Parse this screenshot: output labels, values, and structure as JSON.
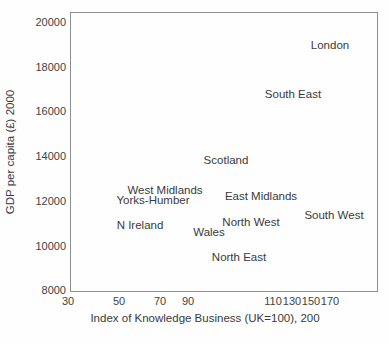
{
  "chart_data": {
    "type": "scatter",
    "title": "",
    "xlabel": "Index of Knowledge Business (UK=100), 200",
    "ylabel": "GDP per capita (£) 2000",
    "xlim": [
      30,
      170
    ],
    "ylim": [
      8000,
      20000
    ],
    "grid": false,
    "legend": "none",
    "marker_style": "text-labels-only",
    "points": [
      {
        "label": "London",
        "x": 165,
        "y": 19000,
        "px": 330,
        "py": 45
      },
      {
        "label": "South East",
        "x": 130,
        "y": 16800,
        "px": 293,
        "py": 94
      },
      {
        "label": "Scotland",
        "x": 98,
        "y": 13850,
        "px": 226,
        "py": 160
      },
      {
        "label": "West Midlands",
        "x": 73,
        "y": 12500,
        "px": 165,
        "py": 190
      },
      {
        "label": "Yorks-Humber",
        "x": 66,
        "y": 12100,
        "px": 153,
        "py": 200
      },
      {
        "label": "East Midlands",
        "x": 107,
        "y": 12250,
        "px": 261,
        "py": 196
      },
      {
        "label": "South West",
        "x": 172,
        "y": 11400,
        "px": 334,
        "py": 215
      },
      {
        "label": "North West",
        "x": 104,
        "y": 11100,
        "px": 251,
        "py": 222
      },
      {
        "label": "N Ireland",
        "x": 59,
        "y": 10950,
        "px": 140,
        "py": 225
      },
      {
        "label": "Wales",
        "x": 95,
        "y": 10650,
        "px": 209,
        "py": 232
      },
      {
        "label": "North East",
        "x": 101,
        "y": 9500,
        "px": 239,
        "py": 257
      }
    ],
    "x_ticks": [
      {
        "value": "30",
        "px": 68
      },
      {
        "value": "50",
        "px": 119
      },
      {
        "value": "70",
        "px": 160
      },
      {
        "value": "90",
        "px": 188
      },
      {
        "value": "110",
        "px": 273
      },
      {
        "value": "130",
        "px": 292
      },
      {
        "value": "150",
        "px": 311
      },
      {
        "value": "170",
        "px": 330
      }
    ],
    "y_ticks": [
      {
        "value": "20000",
        "py": 22
      },
      {
        "value": "18000",
        "py": 67
      },
      {
        "value": "16000",
        "py": 111
      },
      {
        "value": "14000",
        "py": 156
      },
      {
        "value": "12000",
        "py": 201
      },
      {
        "value": "10000",
        "py": 246
      },
      {
        "value": "8000",
        "py": 290
      }
    ]
  },
  "colors": {
    "background": "#fefefe",
    "plot_border": "#8f8f8f",
    "text": "#3a3a3a"
  }
}
